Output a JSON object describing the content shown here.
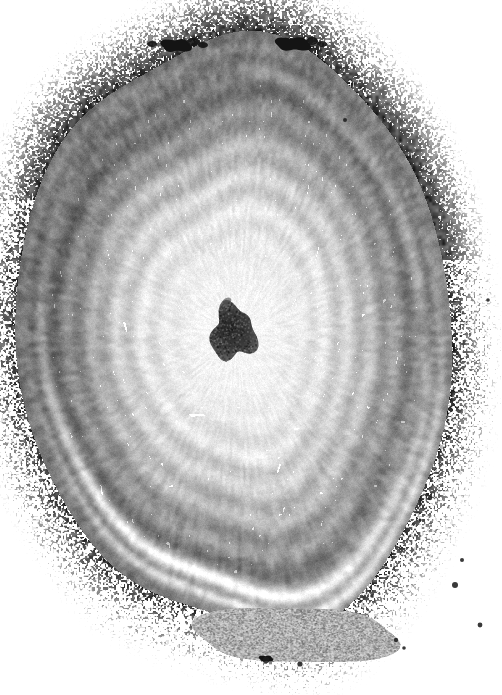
{
  "figure": {
    "domain": "Natural-Image",
    "kind": "histology-micrograph",
    "stain_appearance": "grayscale monochrome, high-contrast halftone print reproduction",
    "orientation": "transverse (cross) section",
    "width_px": 502,
    "height_px": 695,
    "background_color": "#ffffff",
    "has_visible_text": false,
    "has_scale_bar": false,
    "has_labels": false,
    "has_annotations": false,
    "caption": "",
    "colors": {
      "page_background": "#ffffff",
      "lightest_tissue": "#ececec",
      "pale_intima": "#e0e0e0",
      "mid_gray_media": "#b0b0b0",
      "dark_band": "#7a7a7a",
      "darkest_band": "#5a5a5a",
      "ink_black": "#141414",
      "lumen_core": "#2e2e2e"
    }
  },
  "structures": [
    {
      "name": "tissue-field",
      "label": "Vessel cross-section",
      "description": "Large oval tissue block filling most of the frame, bounded by white background on all sides.",
      "bbox": [
        28,
        34,
        444,
        628
      ],
      "tone": "#c8c8c8"
    },
    {
      "name": "adventitia",
      "label": "Adventitia (outer layer)",
      "description": "Dark, densely fibrous laminated outer shell with speckled loose connective tissue fraying into the white background, heaviest at upper-left and right margins.",
      "bbox": [
        28,
        34,
        444,
        628
      ],
      "tone": "#7a7a7a"
    },
    {
      "name": "media",
      "label": "Media (muscular layer)",
      "description": "Broad concentric mid-gray ring of circumferential elastic lamellae; several alternating light and dark arcs are visible.",
      "bbox": [
        52,
        62,
        390,
        520
      ],
      "tone": "#a4a4a4"
    },
    {
      "name": "intima-plaque",
      "label": "Thickened intima / concentric plaque",
      "description": "Very pale, nearly homogeneous concentric mass occupying the vessel interior, showing faint onion-skin laminations around the centre.",
      "bbox": [
        78,
        96,
        330,
        444
      ],
      "tone": "#e4e4e4"
    },
    {
      "name": "residual-lumen",
      "label": "Residual lumen",
      "description": "Small irregular near-black blob at the geometric centre of the pale mass, the tiny remaining channel.",
      "bbox": [
        211,
        306,
        44,
        54
      ],
      "tone": "#2e2e2e"
    },
    {
      "name": "perivascular-body",
      "label": "Perivascular structure",
      "description": "Elongated oval granular body lying outside the vessel wall along the bottom edge, separated by a pale cleft.",
      "bbox": [
        196,
        606,
        200,
        58
      ],
      "tone": "#9c9c9c"
    },
    {
      "name": "ink-blob-left",
      "label": "Dense ink artifact (upper left of top margin)",
      "description": "Solid black halftone blot on the upper tissue margin.",
      "bbox": [
        163,
        38,
        26,
        15
      ],
      "tone": "#141414"
    },
    {
      "name": "ink-blob-right",
      "label": "Dense ink artifact (upper right of top margin)",
      "description": "Second solid black halftone blot on the upper tissue margin.",
      "bbox": [
        278,
        36,
        30,
        16
      ],
      "tone": "#141414"
    },
    {
      "name": "ink-dot-bottom",
      "label": "Dense ink artifact (bottom margin)",
      "description": "Small solid black dot beneath the perivascular body.",
      "bbox": [
        260,
        655,
        12,
        7
      ],
      "tone": "#141414"
    },
    {
      "name": "speckle-field-top-right",
      "label": "Loose adventitial speckle (top right)",
      "description": "Sparse scattered dark flecks on white, fraying outward from the upper-right tissue edge.",
      "bbox": [
        380,
        30,
        120,
        120
      ],
      "tone": "#6e6e6e"
    },
    {
      "name": "pale-cleft-bottom",
      "label": "Pale cleft / separation plane",
      "description": "White and near-white laminated gaps separating media from adventitia along the lower border.",
      "bbox": [
        60,
        555,
        330,
        60
      ],
      "tone": "#f2f2f2"
    }
  ],
  "render": {
    "noise": {
      "grain_amplitude": 26,
      "fine_grain_amplitude": 14,
      "speckle_density": 0.035
    },
    "lamellae": {
      "count": 9,
      "inner_radius_frac": 0.22,
      "outer_radius_frac": 1.0,
      "amplitude": 30
    },
    "center": {
      "x": 236,
      "y": 332
    },
    "radii": {
      "rx": 214,
      "ry": 300
    }
  }
}
